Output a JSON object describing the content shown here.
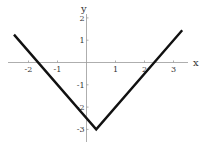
{
  "chart_data": {
    "type": "line",
    "title": "",
    "xlabel": "x",
    "ylabel": "y",
    "function_form": "y = 1.5|x - 1/3| - 3",
    "x": [
      -2.5,
      0.333,
      3.3
    ],
    "series": [
      {
        "name": "f(x)",
        "values": [
          1.25,
          -3,
          1.45
        ]
      }
    ],
    "vertex": {
      "x": 0.333,
      "y": -3
    },
    "x_intercepts": [
      -1.667,
      2.333
    ],
    "xlim": [
      -2.7,
      3.5
    ],
    "ylim": [
      -3.5,
      2.4
    ],
    "xticks": [
      -2,
      -1,
      1,
      2,
      3
    ],
    "yticks": [
      2,
      1,
      -1,
      -2,
      -3
    ],
    "xtick_labels": [
      "-2",
      "-1",
      "1",
      "2",
      "3"
    ],
    "ytick_labels": [
      "2",
      "1",
      "-1",
      "-2",
      "-3"
    ],
    "grid": false,
    "legend": null,
    "line_color": "#111111",
    "axis_color": "#999999"
  }
}
